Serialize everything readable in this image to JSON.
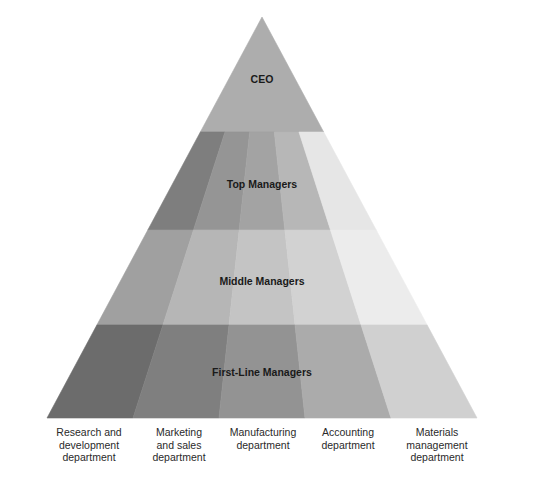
{
  "diagram": {
    "type": "organizational-pyramid",
    "tiers": [
      {
        "label": "CEO",
        "colors": [
          "#adadad"
        ]
      },
      {
        "label": "Top Managers",
        "colors": [
          "#7e7e7e",
          "#959595",
          "#a3a3a3",
          "#b7b7b7",
          "#e6e6e6"
        ]
      },
      {
        "label": "Middle Managers",
        "colors": [
          "#a0a0a0",
          "#b6b6b6",
          "#c4c4c4",
          "#d2d2d2",
          "#ececec"
        ]
      },
      {
        "label": "First-Line Managers",
        "colors": [
          "#6c6c6c",
          "#7f7f7f",
          "#939393",
          "#ababab",
          "#d0d0d0"
        ]
      }
    ],
    "departments": [
      {
        "label": "Research and\ndevelopment\ndepartment"
      },
      {
        "label": "Marketing\nand sales\ndepartment"
      },
      {
        "label": "Manufacturing\ndepartment"
      },
      {
        "label": "Accounting\ndepartment"
      },
      {
        "label": "Materials\nmanagement\ndepartment"
      }
    ]
  }
}
